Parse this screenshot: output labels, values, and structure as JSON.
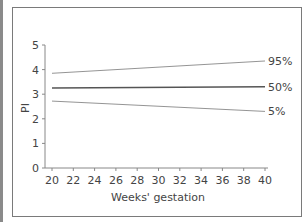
{
  "chart_data": {
    "type": "line",
    "title": "",
    "xlabel": "Weeks' gestation",
    "ylabel": "PI",
    "xlim": [
      20,
      40
    ],
    "ylim": [
      0,
      5
    ],
    "x_ticks": [
      20,
      22,
      24,
      26,
      28,
      30,
      32,
      34,
      36,
      38,
      40
    ],
    "y_ticks": [
      0,
      1,
      2,
      3,
      4,
      5
    ],
    "grid": false,
    "legend": "inline labels at line ends (right)",
    "x": [
      20,
      40
    ],
    "series": [
      {
        "name": "95%",
        "values": [
          3.85,
          4.35
        ]
      },
      {
        "name": "50%",
        "values": [
          3.25,
          3.3
        ]
      },
      {
        "name": "5%",
        "values": [
          2.72,
          2.3
        ]
      }
    ]
  }
}
